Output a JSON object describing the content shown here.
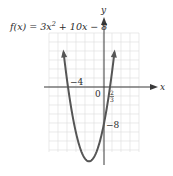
{
  "chart_data": {
    "type": "line",
    "title_parts": {
      "lhs": "f(x) = 3x",
      "exp": "2",
      "rhs": " + 10x − 8"
    },
    "function": {
      "a": 3,
      "b": 10,
      "c": -8
    },
    "xlabel": "x",
    "ylabel": "y",
    "xlim": [
      -6,
      4
    ],
    "ylim": [
      -18,
      8
    ],
    "grid": true,
    "annotations": [
      {
        "label": "-4",
        "x": -4,
        "y": 0,
        "meaning": "x-intercept"
      },
      {
        "label": "0",
        "x": 0,
        "y": 0,
        "meaning": "origin"
      },
      {
        "label": "2/3",
        "x": 0.6667,
        "y": 0,
        "meaning": "x-intercept"
      },
      {
        "label": "-8",
        "x": 0,
        "y": -8,
        "meaning": "y-intercept"
      }
    ],
    "key_points": {
      "x_intercepts": [
        -4,
        0.6667
      ],
      "y_intercept": -8,
      "vertex": [
        -1.6667,
        -16.3333
      ]
    },
    "colors": {
      "curve": "#555555",
      "axis": "#3a3a3a",
      "grid": "#dcdcdc",
      "text": "#2b2b2b"
    }
  },
  "labels": {
    "x_axis": "x",
    "y_axis": "y",
    "origin": "0",
    "root_left": "−4",
    "root_right_num": "2",
    "root_right_den": "3",
    "y_intercept": "−8",
    "title_lhs": "f(x) = 3x",
    "title_exp": "2",
    "title_rhs": " + 10x − 8"
  }
}
